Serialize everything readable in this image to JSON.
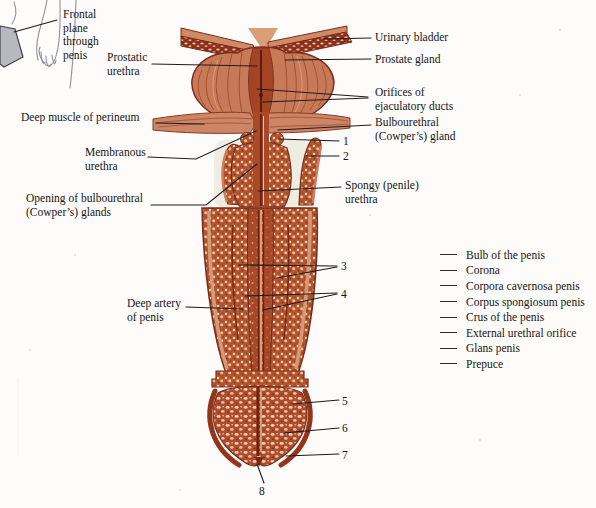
{
  "labels": {
    "frontal_plane": "Frontal\nplane\nthrough\npenis",
    "prostatic_urethra": "Prostatic\nurethra",
    "urinary_bladder": "Urinary bladder",
    "prostate_gland": "Prostate gland",
    "orifices_ejaculatory": "Orifices of\nejaculatory ducts",
    "deep_muscle_perineum": "Deep muscle of perineum",
    "bulbourethral_gland": "Bulbourethral\n(Cowper’s) gland",
    "membranous_urethra": "Membranous\nurethra",
    "spongy_urethra": "Spongy (penile)\nurethra",
    "opening_bulbourethral": "Opening of bulbourethral\n(Cowper’s) glands",
    "deep_artery": "Deep artery\nof penis"
  },
  "numbers": [
    "1",
    "2",
    "3",
    "4",
    "5",
    "6",
    "7",
    "8"
  ],
  "key_list": [
    "Bulb of the penis",
    "Corona",
    "Corpora cavernosa penis",
    "Corpus spongiosum penis",
    "Crus of the penis",
    "External urethral orifice",
    "Glans penis",
    "Prepuce"
  ],
  "colors": {
    "background": "#fdfcfa",
    "leader_line": "#1c1c1c",
    "tissue_base": "#b5532f",
    "tissue_outline": "#7a2c1a",
    "speckle_cream": "#edd2ad",
    "corpus_spongiosum": "#a8492a",
    "muscle": "#cc8565",
    "frontal_plane_gray": "#b6bac0"
  }
}
